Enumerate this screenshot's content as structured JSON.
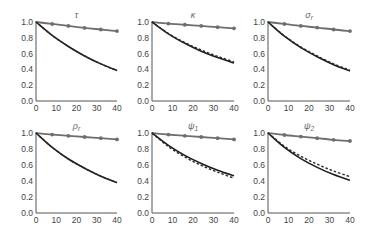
{
  "chart_data": [
    {
      "type": "line",
      "title": "τ",
      "title_sub": "",
      "x": [
        0,
        8,
        16,
        24,
        32,
        40
      ],
      "xticks": [
        0,
        10,
        20,
        30,
        40
      ],
      "yticks": [
        "0.0",
        "0.2",
        "0.4",
        "0.6",
        "0.8",
        "1.0"
      ],
      "xlim": [
        0,
        40
      ],
      "ylim": [
        0,
        1
      ],
      "series": [
        {
          "name": "upper-marked",
          "style": "solid-markers",
          "values": [
            1.0,
            0.975,
            0.95,
            0.925,
            0.905,
            0.885
          ]
        },
        {
          "name": "lower-solid",
          "style": "solid",
          "values": [
            1.0,
            0.83,
            0.69,
            0.57,
            0.47,
            0.385
          ]
        },
        {
          "name": "lower-dashed",
          "style": "dashed",
          "values": [
            1.0,
            0.83,
            0.69,
            0.57,
            0.47,
            0.385
          ]
        }
      ]
    },
    {
      "type": "line",
      "title": "κ",
      "title_sub": "",
      "x": [
        0,
        8,
        16,
        24,
        32,
        40
      ],
      "xticks": [
        0,
        10,
        20,
        30,
        40
      ],
      "yticks": [
        "0.0",
        "0.2",
        "0.4",
        "0.6",
        "0.8",
        "1.0"
      ],
      "xlim": [
        0,
        40
      ],
      "ylim": [
        0,
        1
      ],
      "series": [
        {
          "name": "upper-marked",
          "style": "solid-markers",
          "values": [
            1.0,
            0.98,
            0.965,
            0.95,
            0.935,
            0.92
          ]
        },
        {
          "name": "lower-solid",
          "style": "solid",
          "values": [
            1.0,
            0.85,
            0.73,
            0.63,
            0.55,
            0.48
          ]
        },
        {
          "name": "lower-dashed",
          "style": "dashed",
          "values": [
            1.0,
            0.855,
            0.74,
            0.645,
            0.565,
            0.495
          ]
        }
      ]
    },
    {
      "type": "line",
      "title": "σ",
      "title_sub": "r",
      "x": [
        0,
        8,
        16,
        24,
        32,
        40
      ],
      "xticks": [
        0,
        10,
        20,
        30,
        40
      ],
      "yticks": [
        "0.0",
        "0.2",
        "0.4",
        "0.6",
        "0.8",
        "1.0"
      ],
      "xlim": [
        0,
        40
      ],
      "ylim": [
        0,
        1
      ],
      "series": [
        {
          "name": "upper-marked",
          "style": "solid-markers",
          "values": [
            1.0,
            0.975,
            0.95,
            0.93,
            0.905,
            0.885
          ]
        },
        {
          "name": "lower-solid",
          "style": "solid",
          "values": [
            1.0,
            0.82,
            0.675,
            0.56,
            0.46,
            0.38
          ]
        },
        {
          "name": "lower-dashed",
          "style": "dashed",
          "values": [
            1.0,
            0.825,
            0.685,
            0.57,
            0.47,
            0.39
          ]
        }
      ]
    },
    {
      "type": "line",
      "title": "ρ",
      "title_sub": "r",
      "x": [
        0,
        8,
        16,
        24,
        32,
        40
      ],
      "xticks": [
        0,
        10,
        20,
        30,
        40
      ],
      "yticks": [
        "0.0",
        "0.2",
        "0.4",
        "0.6",
        "0.8",
        "1.0"
      ],
      "xlim": [
        0,
        40
      ],
      "ylim": [
        0,
        1
      ],
      "series": [
        {
          "name": "upper-marked",
          "style": "solid-markers",
          "values": [
            1.0,
            0.98,
            0.965,
            0.95,
            0.935,
            0.92
          ]
        },
        {
          "name": "lower-solid",
          "style": "solid",
          "values": [
            1.0,
            0.82,
            0.675,
            0.56,
            0.46,
            0.38
          ]
        },
        {
          "name": "lower-dashed",
          "style": "dashed",
          "values": [
            1.0,
            0.82,
            0.675,
            0.56,
            0.46,
            0.38
          ]
        }
      ]
    },
    {
      "type": "line",
      "title": "ψ",
      "title_sub": "1",
      "x": [
        0,
        8,
        16,
        24,
        32,
        40
      ],
      "xticks": [
        0,
        10,
        20,
        30,
        40
      ],
      "yticks": [
        "0.0",
        "0.2",
        "0.4",
        "0.6",
        "0.8",
        "1.0"
      ],
      "xlim": [
        0,
        40
      ],
      "ylim": [
        0,
        1
      ],
      "series": [
        {
          "name": "upper-marked",
          "style": "solid-markers",
          "values": [
            1.0,
            0.98,
            0.965,
            0.95,
            0.935,
            0.92
          ]
        },
        {
          "name": "lower-solid",
          "style": "solid",
          "values": [
            1.0,
            0.845,
            0.72,
            0.62,
            0.535,
            0.465
          ]
        },
        {
          "name": "lower-dashed",
          "style": "dashed",
          "values": [
            1.0,
            0.83,
            0.7,
            0.595,
            0.51,
            0.435
          ]
        }
      ]
    },
    {
      "type": "line",
      "title": "ψ",
      "title_sub": "2",
      "x": [
        0,
        8,
        16,
        24,
        32,
        40
      ],
      "xticks": [
        0,
        10,
        20,
        30,
        40
      ],
      "yticks": [
        "0.0",
        "0.2",
        "0.4",
        "0.6",
        "0.8",
        "1.0"
      ],
      "xlim": [
        0,
        40
      ],
      "ylim": [
        0,
        1
      ],
      "series": [
        {
          "name": "upper-marked",
          "style": "solid-markers",
          "values": [
            1.0,
            0.975,
            0.955,
            0.935,
            0.915,
            0.9
          ]
        },
        {
          "name": "lower-solid",
          "style": "solid",
          "values": [
            1.0,
            0.82,
            0.68,
            0.57,
            0.48,
            0.41
          ]
        },
        {
          "name": "lower-dashed",
          "style": "dashed",
          "values": [
            1.0,
            0.835,
            0.71,
            0.61,
            0.525,
            0.455
          ]
        }
      ]
    }
  ],
  "layout": {
    "panels": [
      {
        "x0": 36,
        "x1": 117,
        "y0": 101,
        "y1": 22
      },
      {
        "x0": 152,
        "x1": 234,
        "y0": 101,
        "y1": 22
      },
      {
        "x0": 268,
        "x1": 350,
        "y0": 101,
        "y1": 22
      },
      {
        "x0": 36,
        "x1": 117,
        "y0": 213,
        "y1": 133
      },
      {
        "x0": 152,
        "x1": 234,
        "y0": 213,
        "y1": 133
      },
      {
        "x0": 268,
        "x1": 350,
        "y0": 213,
        "y1": 133
      }
    ],
    "colors": {
      "upper": "#6e6e6e",
      "lower": "#1e1e1e",
      "dashed": "#2a2a2a",
      "axis": "#555555",
      "text": "#444444"
    }
  }
}
